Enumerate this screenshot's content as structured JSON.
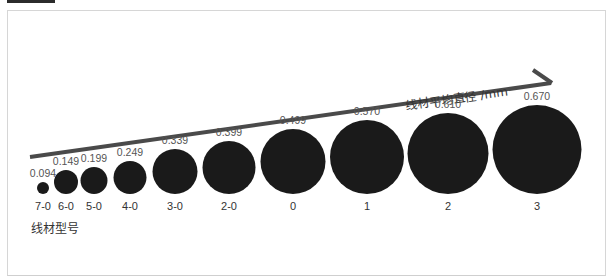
{
  "diagram": {
    "axis_label": "线材平均直径 /mm",
    "category_label": "线材型号",
    "wires": [
      {
        "gauge": "7-0",
        "diameter_label": "0.094",
        "cx": 43,
        "d": 12
      },
      {
        "gauge": "6-0",
        "diameter_label": "0.149",
        "cx": 66,
        "d": 24
      },
      {
        "gauge": "5-0",
        "diameter_label": "0.199",
        "cx": 94,
        "d": 27
      },
      {
        "gauge": "4-0",
        "diameter_label": "0.249",
        "cx": 130,
        "d": 33
      },
      {
        "gauge": "3-0",
        "diameter_label": "0.339",
        "cx": 175,
        "d": 45
      },
      {
        "gauge": "2-0",
        "diameter_label": "0.399",
        "cx": 229,
        "d": 53
      },
      {
        "gauge": "0",
        "diameter_label": "0.499",
        "cx": 293,
        "d": 65
      },
      {
        "gauge": "1",
        "diameter_label": "0.570",
        "cx": 367,
        "d": 74
      },
      {
        "gauge": "2",
        "diameter_label": "0.610",
        "cx": 448,
        "d": 81
      },
      {
        "gauge": "3",
        "diameter_label": "0.670",
        "cx": 537,
        "d": 89
      }
    ],
    "colors": {
      "circle": "#1a1a1a",
      "arrow": "#4a4a4a",
      "text": "#555555"
    }
  },
  "chart_data": {
    "type": "bubble",
    "title": "",
    "xlabel": "线材型号",
    "ylabel": "线材平均直径 /mm",
    "categories": [
      "7-0",
      "6-0",
      "5-0",
      "4-0",
      "3-0",
      "2-0",
      "0",
      "1",
      "2",
      "3"
    ],
    "values": [
      0.094,
      0.149,
      0.199,
      0.249,
      0.339,
      0.399,
      0.499,
      0.57,
      0.61,
      0.67
    ]
  }
}
